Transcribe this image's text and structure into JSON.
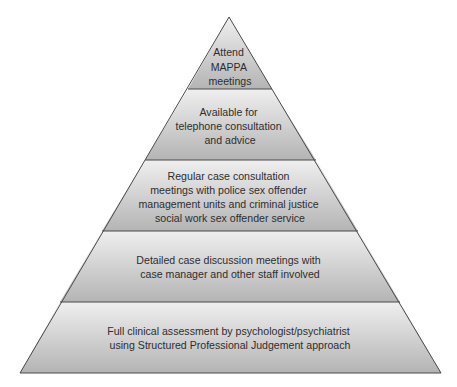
{
  "diagram": {
    "type": "pyramid",
    "orientation": "apex-up",
    "colors": {
      "layer_top": "#efefef",
      "layer_bottom": "#b4b4b4",
      "outline": "#4a4a4a",
      "text": "#2e2e2e",
      "background": "#ffffff"
    },
    "layers": [
      {
        "level": 1,
        "lines": [
          "Attend",
          "MAPPA",
          "meetings"
        ]
      },
      {
        "level": 2,
        "lines": [
          "Available for",
          "telephone consultation",
          "and advice"
        ]
      },
      {
        "level": 3,
        "lines": [
          "Regular case consultation",
          "meetings with police sex offender",
          "management units and criminal justice",
          "social work sex offender service"
        ]
      },
      {
        "level": 4,
        "lines": [
          "Detailed case discussion meetings with",
          "case manager and other staff involved"
        ]
      },
      {
        "level": 5,
        "lines": [
          "Full clinical assessment by psychologist/psychiatrist",
          "using Structured Professional Judgement approach"
        ]
      }
    ]
  }
}
